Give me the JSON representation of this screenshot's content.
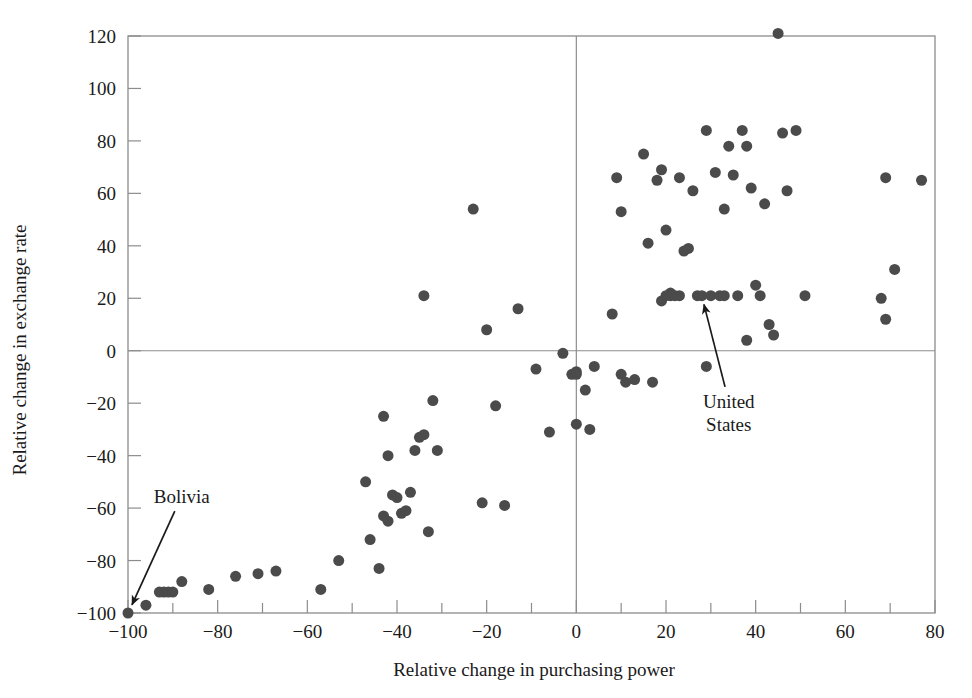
{
  "chart_data": {
    "type": "scatter",
    "title": "",
    "xlabel": "Relative change in purchasing power",
    "ylabel": "Relative change in exchange rate",
    "xlim": [
      -100,
      80
    ],
    "ylim": [
      -100,
      120
    ],
    "x_tick_step": 10,
    "x_label_step": 20,
    "y_tick_step": 20,
    "y_label_step": 20,
    "xticks": [
      -100,
      -80,
      -60,
      -40,
      -20,
      0,
      20,
      40,
      60,
      80
    ],
    "yticks": [
      -100,
      -80,
      -60,
      -40,
      -20,
      0,
      20,
      40,
      60,
      80,
      100,
      120
    ],
    "xtick_labels": [
      "−100",
      "−80",
      "−60",
      "−40",
      "−20",
      "0",
      "20",
      "40",
      "60",
      "80"
    ],
    "ytick_labels": [
      "−100",
      "−80",
      "−60",
      "−40",
      "−20",
      "0",
      "20",
      "40",
      "60",
      "80",
      "100",
      "120"
    ],
    "grid": false,
    "zero_lines": true,
    "legend": "none",
    "marker_color": "#4b4b4b",
    "marker_size": 11,
    "frame_color": "#8c8c8c",
    "points": [
      [
        -100,
        -100
      ],
      [
        -96,
        -97
      ],
      [
        -93,
        -92
      ],
      [
        -92,
        -92
      ],
      [
        -91,
        -92
      ],
      [
        -90,
        -92
      ],
      [
        -88,
        -88
      ],
      [
        -82,
        -91
      ],
      [
        -76,
        -86
      ],
      [
        -71,
        -85
      ],
      [
        -67,
        -84
      ],
      [
        -57,
        -91
      ],
      [
        -53,
        -80
      ],
      [
        -47,
        -50
      ],
      [
        -46,
        -72
      ],
      [
        -44,
        -83
      ],
      [
        -43,
        -25
      ],
      [
        -43,
        -63
      ],
      [
        -42,
        -65
      ],
      [
        -42,
        -40
      ],
      [
        -41,
        -55
      ],
      [
        -40,
        -56
      ],
      [
        -39,
        -62
      ],
      [
        -38,
        -61
      ],
      [
        -37,
        -54
      ],
      [
        -36,
        -38
      ],
      [
        -35,
        -33
      ],
      [
        -34,
        -32
      ],
      [
        -34,
        21
      ],
      [
        -33,
        -69
      ],
      [
        -32,
        -19
      ],
      [
        -31,
        -38
      ],
      [
        -23,
        54
      ],
      [
        -21,
        -58
      ],
      [
        -20,
        8
      ],
      [
        -18,
        -21
      ],
      [
        -16,
        -59
      ],
      [
        -13,
        16
      ],
      [
        -9,
        -7
      ],
      [
        -6,
        -31
      ],
      [
        -3,
        -1
      ],
      [
        -1,
        -9
      ],
      [
        0,
        -9
      ],
      [
        0,
        -8
      ],
      [
        0,
        -28
      ],
      [
        2,
        -15
      ],
      [
        3,
        -30
      ],
      [
        4,
        -6
      ],
      [
        8,
        14
      ],
      [
        9,
        66
      ],
      [
        10,
        53
      ],
      [
        10,
        -9
      ],
      [
        11,
        -12
      ],
      [
        13,
        -11
      ],
      [
        15,
        75
      ],
      [
        16,
        41
      ],
      [
        17,
        -12
      ],
      [
        18,
        65
      ],
      [
        19,
        69
      ],
      [
        19,
        19
      ],
      [
        20,
        46
      ],
      [
        20,
        21
      ],
      [
        21,
        22
      ],
      [
        21,
        21
      ],
      [
        22,
        21
      ],
      [
        23,
        66
      ],
      [
        23,
        21
      ],
      [
        24,
        38
      ],
      [
        25,
        39
      ],
      [
        26,
        61
      ],
      [
        27,
        21
      ],
      [
        28,
        21
      ],
      [
        29,
        84
      ],
      [
        29,
        -6
      ],
      [
        30,
        21
      ],
      [
        31,
        68
      ],
      [
        32,
        21
      ],
      [
        33,
        21
      ],
      [
        33,
        54
      ],
      [
        34,
        78
      ],
      [
        35,
        67
      ],
      [
        36,
        21
      ],
      [
        37,
        84
      ],
      [
        38,
        78
      ],
      [
        38,
        4
      ],
      [
        39,
        62
      ],
      [
        40,
        25
      ],
      [
        41,
        21
      ],
      [
        42,
        56
      ],
      [
        43,
        10
      ],
      [
        44,
        6
      ],
      [
        45,
        121
      ],
      [
        46,
        83
      ],
      [
        47,
        61
      ],
      [
        49,
        84
      ],
      [
        51,
        21
      ],
      [
        68,
        20
      ],
      [
        69,
        66
      ],
      [
        69,
        12
      ],
      [
        71,
        31
      ],
      [
        77,
        65
      ]
    ],
    "annotations": [
      {
        "label": "Bolivia",
        "label_lines": [
          "Bolivia"
        ],
        "point": [
          -100,
          -100
        ],
        "label_x": -88,
        "label_y": -58
      },
      {
        "label": "United States",
        "label_lines": [
          "United",
          "States"
        ],
        "point": [
          28,
          21
        ],
        "label_x": 34,
        "label_y": -22
      }
    ]
  }
}
